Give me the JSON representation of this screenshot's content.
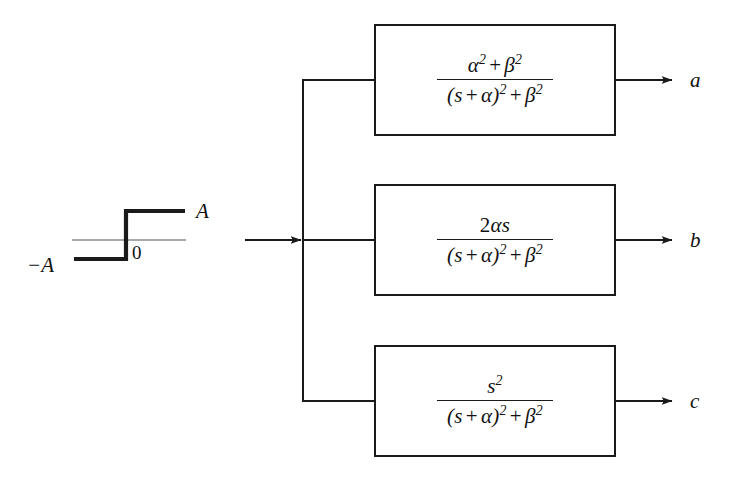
{
  "figure": {
    "type": "signal-flow-block-diagram",
    "background_color": "#ffffff",
    "line_color": "#1a1a1a"
  },
  "input_signal": {
    "name": "step-function-waveform",
    "description": "Bipolar step from -A to +A at t = 0",
    "labels": {
      "upper_level": "A",
      "lower_level": "−A",
      "origin": "0"
    },
    "axis": {
      "x_start": 72,
      "x_end": 186,
      "y": 240
    },
    "step": {
      "low_y": 259,
      "high_y": 211,
      "transition_x": 126,
      "low_x_start": 74,
      "high_x_end": 185
    }
  },
  "bus": {
    "name": "input-distribution-bus",
    "arrow_x_start": 245,
    "arrow_x_end": 300,
    "x": 303,
    "y_top": 80,
    "y_bottom": 401,
    "y_mid": 240
  },
  "blocks": [
    {
      "id": "block-a",
      "name": "transfer-function-block-a",
      "numerator": "α² + β²",
      "denominator": "(s + α)² + β²",
      "num_parts": {
        "base1": "α",
        "exp1": "2",
        "operator": "+",
        "base2": "β",
        "exp2": "2"
      },
      "output_label": "a",
      "geometry": {
        "left": 374,
        "top": 24,
        "width": 242,
        "height": 112
      },
      "input_y": 80,
      "output_y": 80
    },
    {
      "id": "block-b",
      "name": "transfer-function-block-b",
      "numerator": "2αs",
      "denominator": "(s + α)² + β²",
      "num_parts": {
        "coefficient": "2",
        "base1": "α",
        "base2": "s"
      },
      "output_label": "b",
      "geometry": {
        "left": 374,
        "top": 184,
        "width": 242,
        "height": 112
      },
      "input_y": 240,
      "output_y": 240
    },
    {
      "id": "block-c",
      "name": "transfer-function-block-c",
      "numerator": "s²",
      "denominator": "(s + α)² + β²",
      "num_parts": {
        "base1": "s",
        "exp1": "2"
      },
      "output_label": "c",
      "geometry": {
        "left": 374,
        "top": 345,
        "width": 242,
        "height": 112
      },
      "input_y": 401,
      "output_y": 401
    }
  ],
  "denominator_parts": {
    "open_paren": "(",
    "s": "s",
    "plus1": "+",
    "alpha": "α",
    "close_paren": ")",
    "exp_paren": "2",
    "plus2": "+",
    "beta": "β",
    "exp_beta": "2"
  },
  "outputs": {
    "arrow_x_start": 616,
    "arrow_x_end": 672,
    "label_x": 690,
    "labels": [
      "a",
      "b",
      "c"
    ]
  }
}
